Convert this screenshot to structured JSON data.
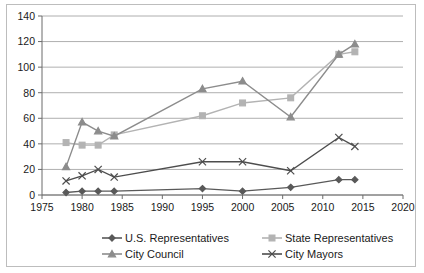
{
  "chart_data": {
    "type": "line",
    "title": "",
    "xlabel": "",
    "ylabel": "",
    "xlim": [
      1975,
      2020
    ],
    "ylim": [
      0,
      140
    ],
    "ytick_step": 20,
    "xtick_step": 5,
    "grid": "horizontal",
    "legend_position": "bottom",
    "xticks": [
      "1975",
      "1980",
      "1985",
      "1990",
      "1995",
      "2000",
      "2005",
      "2010",
      "2015",
      "2020"
    ],
    "yticks": [
      "0",
      "20",
      "40",
      "60",
      "80",
      "100",
      "120",
      "140"
    ],
    "x": [
      1978,
      1980,
      1982,
      1984,
      1995,
      2000,
      2006,
      2012,
      2014
    ],
    "series": [
      {
        "name": "U.S. Representatives",
        "marker": "diamond",
        "color": "#595959",
        "values": [
          2,
          3,
          3,
          3,
          5,
          3,
          6,
          12,
          12
        ]
      },
      {
        "name": "State Representatives",
        "marker": "square",
        "color": "#b3b3b3",
        "values": [
          41,
          39,
          39,
          47,
          62,
          72,
          76,
          110,
          112
        ]
      },
      {
        "name": "City Council",
        "marker": "triangle",
        "color": "#8c8c8c",
        "values": [
          22,
          57,
          50,
          46,
          83,
          89,
          61,
          110,
          118
        ]
      },
      {
        "name": "City Mayors",
        "marker": "x",
        "color": "#4d4d4d",
        "values": [
          11,
          15,
          20,
          14,
          26,
          26,
          19,
          45,
          38
        ]
      }
    ]
  },
  "legend": {
    "entries": [
      {
        "label": "U.S. Representatives"
      },
      {
        "label": "State Representatives"
      },
      {
        "label": "City Council"
      },
      {
        "label": "City Mayors"
      }
    ]
  }
}
